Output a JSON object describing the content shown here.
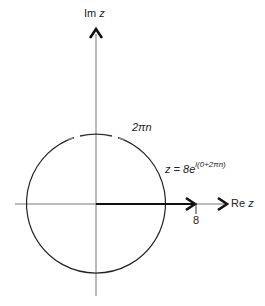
{
  "diagram": {
    "type": "complex-plane",
    "axes": {
      "imag_label_prefix": "Im ",
      "imag_label_var": "z",
      "real_label_prefix": "Re ",
      "real_label_var": "z"
    },
    "circle": {
      "radius_value": "8",
      "center": "origin"
    },
    "vector": {
      "tick_label": "8"
    },
    "annotations": {
      "angle_label": "2πn",
      "equation_main": "z = 8e",
      "equation_exponent": "i(0+2πn)"
    },
    "colors": {
      "line": "#222222",
      "axis": "#555555",
      "background": "#ffffff"
    }
  }
}
